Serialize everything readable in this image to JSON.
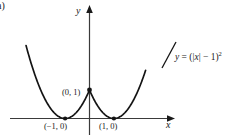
{
  "figure": {
    "part_label": "a)",
    "equation_plain": "y = (|x| - 1)^2",
    "eq_lhs": "y",
    "eq_eq": " = (",
    "eq_bar1": "|",
    "eq_var": "x",
    "eq_bar2": "|",
    "eq_minus": " − 1)",
    "eq_exp": "2"
  },
  "axes": {
    "x_label": "x",
    "y_label": "y"
  },
  "points": [
    {
      "name": "vertex-top",
      "label": "(0, 1)",
      "x": 0,
      "y": 1
    },
    {
      "name": "vertex-left",
      "label": "(−1, 0)",
      "x": -1,
      "y": 0
    },
    {
      "name": "vertex-right",
      "label": "(1, 0)",
      "x": 1,
      "y": 0
    }
  ],
  "colors": {
    "curve": "#141414",
    "axis": "#3a3a3a",
    "text": "#1a1a1a",
    "background": "#ffffff"
  },
  "chart_data": {
    "type": "line",
    "title": "",
    "subtitle": "",
    "xlabel": "x",
    "ylabel": "y",
    "function": "y = (|x| - 1)^2",
    "xlim": [
      -2.6,
      2.3
    ],
    "ylim": [
      -0.35,
      2.6
    ],
    "grid": false,
    "legend": null,
    "annotations": [
      {
        "text": "y = (|x| − 1)²",
        "x": 1.75,
        "y": 1.45
      },
      {
        "text": "(0, 1)",
        "x": -0.35,
        "y": 1.02
      },
      {
        "text": "(−1, 0)",
        "x": -1.0,
        "y": -0.22
      },
      {
        "text": "(1, 0)",
        "x": 1.0,
        "y": -0.22
      },
      {
        "text": "a)",
        "x": -2.6,
        "y": 2.55
      }
    ],
    "markers": [
      {
        "x": 0,
        "y": 1,
        "style": "filled-dot"
      },
      {
        "x": -1,
        "y": 0,
        "style": "filled-dot"
      },
      {
        "x": 1,
        "y": 0,
        "style": "filled-dot"
      }
    ],
    "series": [
      {
        "name": "y = (|x| - 1)^2",
        "x": [
          -2.55,
          -2.4,
          -2.2,
          -2.0,
          -1.8,
          -1.6,
          -1.4,
          -1.2,
          -1.0,
          -0.8,
          -0.6,
          -0.4,
          -0.2,
          0.0,
          0.2,
          0.4,
          0.6,
          0.8,
          1.0,
          1.2,
          1.4,
          1.6,
          1.8,
          2.0,
          2.2,
          2.3
        ],
        "values": [
          2.4025,
          1.96,
          1.44,
          1.0,
          0.64,
          0.36,
          0.16,
          0.04,
          0.0,
          0.04,
          0.16,
          0.36,
          0.64,
          1.0,
          0.64,
          0.36,
          0.16,
          0.04,
          0.0,
          0.04,
          0.16,
          0.36,
          0.64,
          1.0,
          1.44,
          1.69
        ]
      }
    ]
  }
}
